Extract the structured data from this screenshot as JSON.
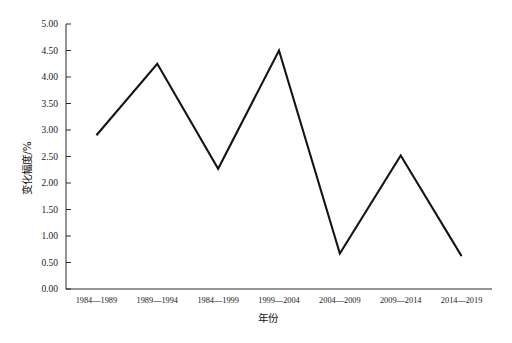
{
  "chart_data": {
    "type": "line",
    "title": "",
    "subtitle": "",
    "xlabel": "年份",
    "ylabel": "变化幅度/%",
    "categories": [
      "1984—1989",
      "1989—1994",
      "1984—1999",
      "1999—2004",
      "2004—2009",
      "2009—2014",
      "2014—2019"
    ],
    "values": [
      2.9,
      4.25,
      2.27,
      4.5,
      0.67,
      2.52,
      0.62
    ],
    "series": [
      {
        "name": "变化幅度",
        "values": [
          2.9,
          4.25,
          2.27,
          4.5,
          0.67,
          2.52,
          0.62
        ]
      }
    ],
    "ylim": [
      0.0,
      5.0
    ],
    "ytick_step": 0.5,
    "ytick_labels": [
      "0.00",
      "0.50",
      "1.00",
      "1.50",
      "2.00",
      "2.50",
      "3.00",
      "3.50",
      "4.00",
      "4.50",
      "5.00"
    ],
    "grid": false,
    "legend": false,
    "legend_position": "none",
    "line_color": "#141414",
    "axis_color": "#2b2b2b",
    "background_color": "#ffffff",
    "markers": false,
    "annotations": []
  }
}
